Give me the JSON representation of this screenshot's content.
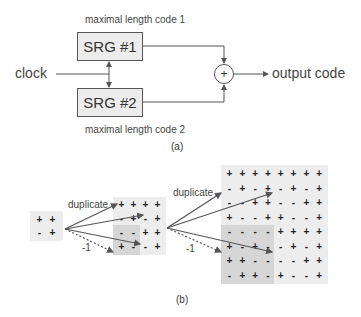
{
  "part_a": {
    "code1_label": "maximal length code 1",
    "code2_label": "maximal length code 2",
    "srg1_label": "SRG #1",
    "srg2_label": "SRG #2",
    "clock_label": "clock",
    "xor_symbol": "+",
    "output_label": "output code",
    "caption": "(a)"
  },
  "part_b": {
    "duplicate_label_1": "duplicate",
    "duplicate_label_2": "duplicate",
    "negate_label_1": "-1",
    "negate_label_2": "-1",
    "caption": "(b)",
    "matrix_2x2": [
      [
        "+",
        "+"
      ],
      [
        "-",
        "+"
      ]
    ],
    "matrix_4x4": [
      [
        "+",
        "+",
        "+",
        "+"
      ],
      [
        "-",
        "+",
        "-",
        "+"
      ],
      [
        "-",
        "-",
        "+",
        "+"
      ],
      [
        "+",
        "-",
        "-",
        "+"
      ]
    ],
    "matrix_8x8": [
      [
        "+",
        "+",
        "+",
        "+",
        "+",
        "+",
        "+",
        "+"
      ],
      [
        "-",
        "+",
        "-",
        "+",
        "-",
        "+",
        "-",
        "+"
      ],
      [
        "-",
        "-",
        "+",
        "+",
        "-",
        "-",
        "+",
        "+"
      ],
      [
        "+",
        "-",
        "-",
        "+",
        "+",
        "-",
        "-",
        "+"
      ],
      [
        "-",
        "-",
        "-",
        "-",
        "+",
        "+",
        "+",
        "+"
      ],
      [
        "+",
        "-",
        "+",
        "-",
        "-",
        "+",
        "-",
        "+"
      ],
      [
        "+",
        "+",
        "-",
        "-",
        "-",
        "-",
        "+",
        "+"
      ],
      [
        "-",
        "+",
        "+",
        "-",
        "+",
        "-",
        "-",
        "+"
      ]
    ]
  },
  "colors": {
    "line": "#555555",
    "matrix_bg": "#ededed",
    "negated_quadrant_bg": "#d6d6d6",
    "box_bg": "#ececec"
  }
}
